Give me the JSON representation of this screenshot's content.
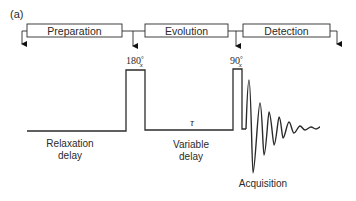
{
  "figure": {
    "panel_label": "(a)",
    "stages": [
      {
        "label": "Preparation"
      },
      {
        "label": "Evolution"
      },
      {
        "label": "Detection"
      }
    ],
    "pulses": [
      {
        "label_main": "180",
        "label_deg": "°",
        "label_sub": "x"
      },
      {
        "label_main": "90",
        "label_deg": "°",
        "label_sub": "x"
      }
    ],
    "delays": {
      "relaxation": {
        "line1": "Relaxation",
        "line2": "delay"
      },
      "variable": {
        "line1": "Variable",
        "line2": "delay",
        "symbol": "τ"
      }
    },
    "acquisition": {
      "label": "Acquisition"
    }
  }
}
